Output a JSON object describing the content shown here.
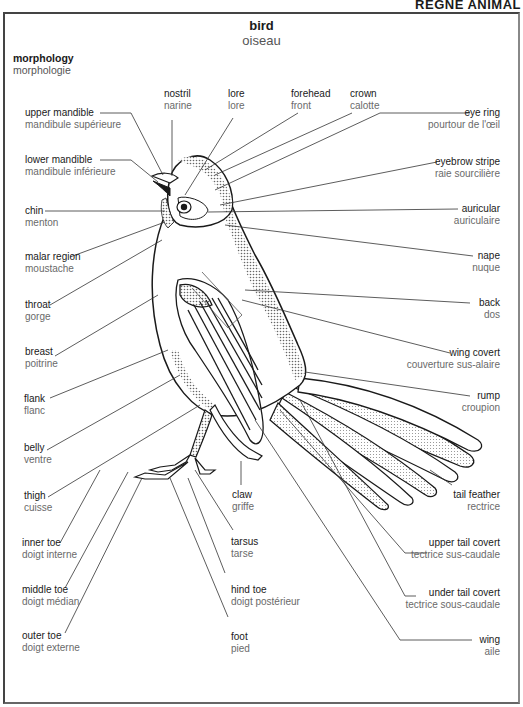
{
  "header": {
    "section": "RÈGNE ANIMAL"
  },
  "title": {
    "en": "bird",
    "fr": "oiseau"
  },
  "section": {
    "en": "morphology",
    "fr": "morphologie"
  },
  "labels": {
    "top": [
      {
        "en": "nostril",
        "fr": "narine"
      },
      {
        "en": "lore",
        "fr": "lore"
      },
      {
        "en": "forehead",
        "fr": "front"
      },
      {
        "en": "crown",
        "fr": "calotte"
      }
    ],
    "left": [
      {
        "en": "upper mandible",
        "fr": "mandibule supérieure"
      },
      {
        "en": "lower mandible",
        "fr": "mandibule inférieure"
      },
      {
        "en": "chin",
        "fr": "menton"
      },
      {
        "en": "malar region",
        "fr": "moustache"
      },
      {
        "en": "throat",
        "fr": "gorge"
      },
      {
        "en": "breast",
        "fr": "poitrine"
      },
      {
        "en": "flank",
        "fr": "flanc"
      },
      {
        "en": "belly",
        "fr": "ventre"
      },
      {
        "en": "thigh",
        "fr": "cuisse"
      },
      {
        "en": "inner toe",
        "fr": "doigt interne"
      },
      {
        "en": "middle toe",
        "fr": "doigt médian"
      },
      {
        "en": "outer toe",
        "fr": "doigt externe"
      }
    ],
    "right": [
      {
        "en": "eye ring",
        "fr": "pourtour de l'œil"
      },
      {
        "en": "eyebrow stripe",
        "fr": "raie sourcilière"
      },
      {
        "en": "auricular",
        "fr": "auriculaire"
      },
      {
        "en": "nape",
        "fr": "nuque"
      },
      {
        "en": "back",
        "fr": "dos"
      },
      {
        "en": "wing covert",
        "fr": "couverture sus-alaire"
      },
      {
        "en": "rump",
        "fr": "croupion"
      },
      {
        "en": "tail feather",
        "fr": "rectrice"
      },
      {
        "en": "upper tail covert",
        "fr": "tectrice sus-caudale"
      },
      {
        "en": "under tail covert",
        "fr": "tectrice sous-caudale"
      },
      {
        "en": "wing",
        "fr": "aile"
      }
    ],
    "bottom": [
      {
        "en": "claw",
        "fr": "griffe"
      },
      {
        "en": "tarsus",
        "fr": "tarse"
      },
      {
        "en": "hind toe",
        "fr": "doigt postérieur"
      },
      {
        "en": "foot",
        "fr": "pied"
      }
    ]
  },
  "colors": {
    "line": "#333333",
    "text_en": "#1a1a1a",
    "text_fr": "#6a6a6a",
    "shade": "#9a9a9a"
  }
}
